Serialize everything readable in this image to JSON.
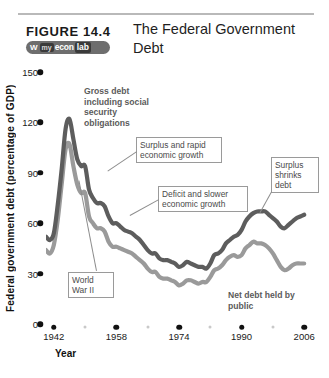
{
  "header": {
    "figure_label": "FIGURE  14.4",
    "title": "The Federal Government Debt",
    "brand": {
      "icon": "w-mark-icon",
      "my": "my",
      "econ": "econ",
      "lab": "lab"
    }
  },
  "axis": {
    "y_title": "Federal government debt (percentage of GDP)",
    "x_title": "Year"
  },
  "annotations": {
    "gross_debt": "Gross debt including social security obligations",
    "surplus_rapid": "Surplus and rapid economic growth",
    "deficit_slower": "Deficit and slower economic growth",
    "surplus_shrinks": "Surplus shrinks debt",
    "world_war": "World War II",
    "net_debt": "Net debt held by public"
  },
  "chart_data": {
    "type": "line",
    "title": "The Federal Government Debt",
    "xlabel": "Year",
    "ylabel": "Federal government debt (percentage of GDP)",
    "xlim": [
      1940,
      2008
    ],
    "ylim": [
      0,
      150
    ],
    "yticks": [
      0,
      30,
      60,
      90,
      120,
      150
    ],
    "xticks": [
      1942,
      1958,
      1974,
      1990,
      2006
    ],
    "xticks_minor": [
      1950,
      1966,
      1982,
      1998
    ],
    "grid": false,
    "legend": "annotated-inline",
    "colors": {
      "gross_debt": "#5d5d5d",
      "net_debt": "#9a9a9a",
      "axis": "#111111",
      "annotation": "#5b5b5b",
      "box_border": "#9a9a9a"
    },
    "series": [
      {
        "name": "Gross debt including social security obligations",
        "color": "#5d5d5d",
        "x": [
          1940,
          1941,
          1942,
          1943,
          1944,
          1945,
          1946,
          1947,
          1948,
          1949,
          1950,
          1951,
          1952,
          1953,
          1954,
          1955,
          1956,
          1957,
          1958,
          1959,
          1960,
          1961,
          1962,
          1963,
          1964,
          1965,
          1966,
          1967,
          1968,
          1969,
          1970,
          1971,
          1972,
          1973,
          1974,
          1975,
          1976,
          1977,
          1978,
          1979,
          1980,
          1981,
          1982,
          1983,
          1984,
          1985,
          1986,
          1987,
          1988,
          1989,
          1990,
          1991,
          1992,
          1993,
          1994,
          1995,
          1996,
          1997,
          1998,
          1999,
          2000,
          2001,
          2002,
          2003,
          2004,
          2005,
          2006
        ],
        "values": [
          52,
          50,
          54,
          71,
          92,
          116,
          122,
          110,
          98,
          94,
          94,
          80,
          75,
          72,
          72,
          70,
          64,
          60,
          60,
          58,
          56,
          55,
          54,
          52,
          50,
          47,
          44,
          42,
          42,
          39,
          38,
          38,
          37,
          36,
          34,
          35,
          37,
          36,
          35,
          34,
          34,
          33,
          36,
          41,
          42,
          44,
          48,
          50,
          52,
          53,
          56,
          61,
          64,
          66,
          67,
          67,
          67,
          65,
          63,
          61,
          58,
          57,
          59,
          61,
          63,
          64,
          65
        ]
      },
      {
        "name": "Net debt held by public",
        "color": "#9a9a9a",
        "x": [
          1940,
          1941,
          1942,
          1943,
          1944,
          1945,
          1946,
          1947,
          1948,
          1949,
          1950,
          1951,
          1952,
          1953,
          1954,
          1955,
          1956,
          1957,
          1958,
          1959,
          1960,
          1961,
          1962,
          1963,
          1964,
          1965,
          1966,
          1967,
          1968,
          1969,
          1970,
          1971,
          1972,
          1973,
          1974,
          1975,
          1976,
          1977,
          1978,
          1979,
          1980,
          1981,
          1982,
          1983,
          1984,
          1985,
          1986,
          1987,
          1988,
          1989,
          1990,
          1991,
          1992,
          1993,
          1994,
          1995,
          1996,
          1997,
          1998,
          1999,
          2000,
          2001,
          2002,
          2003,
          2004,
          2005,
          2006
        ],
        "values": [
          44,
          42,
          47,
          62,
          83,
          104,
          107,
          94,
          83,
          78,
          78,
          64,
          60,
          57,
          57,
          55,
          49,
          46,
          46,
          45,
          44,
          43,
          42,
          40,
          38,
          36,
          33,
          31,
          31,
          28,
          27,
          27,
          26,
          25,
          23,
          24,
          26,
          26,
          25,
          24,
          25,
          25,
          28,
          32,
          33,
          35,
          38,
          40,
          41,
          40,
          41,
          45,
          47,
          49,
          48,
          48,
          47,
          45,
          42,
          38,
          34,
          32,
          33,
          35,
          36,
          36,
          36
        ]
      }
    ]
  }
}
